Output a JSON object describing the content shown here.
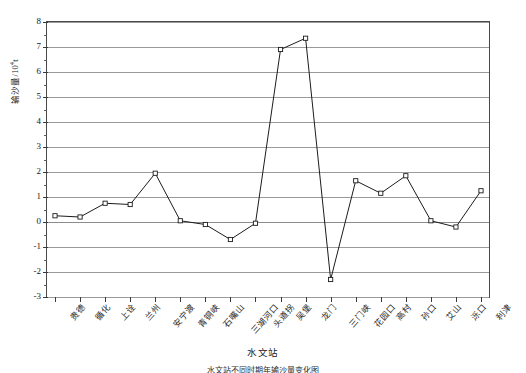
{
  "chart_data": {
    "type": "line",
    "title": "",
    "xlabel": "水文站",
    "ylabel": "输沙量/10⁴t",
    "ylabel_main": "输沙量/10",
    "ylabel_sup": "4",
    "ylabel_unit": "t",
    "ylim": [
      -3,
      8
    ],
    "yticks": [
      8,
      7,
      6,
      5,
      4,
      3,
      2,
      1,
      0,
      -1,
      -2,
      -3
    ],
    "ytick_labels": [
      "8",
      "7",
      "6",
      "5",
      "4",
      "3",
      "2",
      "1",
      "0",
      "-1",
      "-2",
      "-3"
    ],
    "grid": true,
    "legend": "none",
    "categories": [
      "贵德",
      "循化",
      "上诠",
      "兰州",
      "安宁渡",
      "青铜峡",
      "石嘴山",
      "三湖河口",
      "头道拐",
      "吴堡",
      "龙门",
      "三门峡",
      "花园口",
      "高村",
      "孙口",
      "艾山",
      "泺口",
      "利津"
    ],
    "values": [
      0.25,
      0.2,
      0.75,
      0.7,
      1.95,
      0.05,
      -0.1,
      -0.7,
      -0.05,
      6.9,
      7.35,
      -2.3,
      1.65,
      1.15,
      1.85,
      0.05,
      -0.2,
      1.25
    ],
    "series": [
      {
        "name": "输沙量",
        "marker": "open-square",
        "line_color": "#1c1c1c",
        "values": [
          0.25,
          0.2,
          0.75,
          0.7,
          1.95,
          0.05,
          -0.1,
          -0.7,
          -0.05,
          6.9,
          7.35,
          -2.3,
          1.65,
          1.15,
          1.85,
          0.05,
          -0.2,
          1.25
        ]
      }
    ],
    "colors": {
      "line": "#1c1c1c",
      "grid": "#9a9a9a",
      "axis": "#4a4a4a",
      "marker_fill": "#ffffff"
    }
  },
  "caption": {
    "text": "水文站不同时期年输沙量变化图"
  }
}
